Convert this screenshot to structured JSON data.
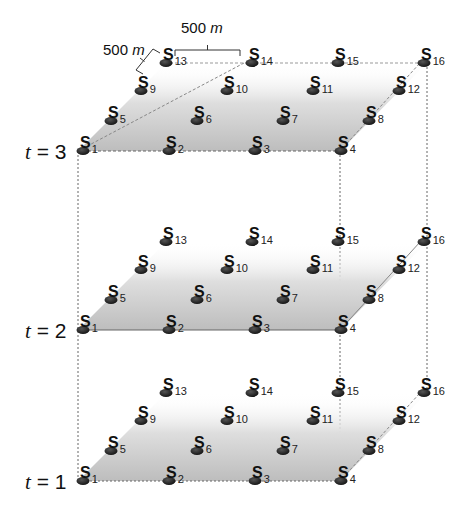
{
  "diagram": {
    "title": "",
    "scale_annotations": [
      {
        "id": "horizontal",
        "value": "500",
        "unit": "m"
      },
      {
        "id": "depth",
        "value": "500",
        "unit": "m"
      }
    ],
    "grid": {
      "rows": 4,
      "cols": 4,
      "spacing": "500 m"
    },
    "layers": [
      {
        "label_var": "t",
        "label_eq": " = ",
        "label_val": "3"
      },
      {
        "label_var": "t",
        "label_eq": " = ",
        "label_val": "2"
      },
      {
        "label_var": "t",
        "label_eq": " = ",
        "label_val": "1"
      }
    ],
    "sites": [
      {
        "letter": "S",
        "index": "1"
      },
      {
        "letter": "S",
        "index": "2"
      },
      {
        "letter": "S",
        "index": "3"
      },
      {
        "letter": "S",
        "index": "4"
      },
      {
        "letter": "S",
        "index": "5"
      },
      {
        "letter": "S",
        "index": "6"
      },
      {
        "letter": "S",
        "index": "7"
      },
      {
        "letter": "S",
        "index": "8"
      },
      {
        "letter": "S",
        "index": "9"
      },
      {
        "letter": "S",
        "index": "10"
      },
      {
        "letter": "S",
        "index": "11"
      },
      {
        "letter": "S",
        "index": "12"
      },
      {
        "letter": "S",
        "index": "13"
      },
      {
        "letter": "S",
        "index": "14"
      },
      {
        "letter": "S",
        "index": "15"
      },
      {
        "letter": "S",
        "index": "16"
      }
    ],
    "colors": {
      "plane_front": "#c4c4c4",
      "plane_back": "#ffffff",
      "marker": "#222222",
      "line": "#555555"
    }
  }
}
